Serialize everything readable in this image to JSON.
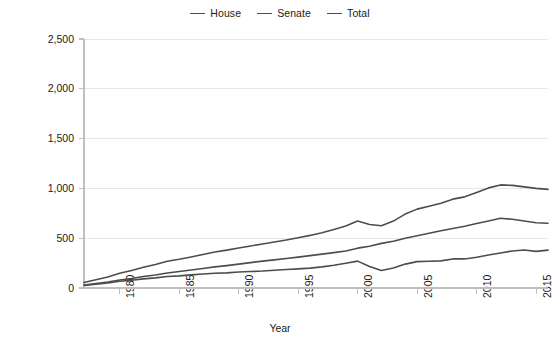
{
  "chart_data": {
    "type": "line",
    "title": "",
    "xlabel": "Year",
    "ylabel": "Millions of Nominal Dollars",
    "xlim": [
      1977,
      2016
    ],
    "ylim": [
      0,
      2500
    ],
    "grid": true,
    "legend_position": "top-center",
    "y_ticks": [
      "0",
      "500",
      "1,000",
      "1,500",
      "2,000",
      "2,500"
    ],
    "y_tick_values": [
      0,
      500,
      1000,
      1500,
      2000,
      2500
    ],
    "x_ticks": [
      "1980",
      "1985",
      "1990",
      "1995",
      "2000",
      "2005",
      "2010",
      "2015"
    ],
    "x_tick_values": [
      1980,
      1985,
      1990,
      1995,
      2000,
      2005,
      2010,
      2015
    ],
    "x": [
      1977,
      1978,
      1979,
      1980,
      1981,
      1982,
      1983,
      1984,
      1985,
      1986,
      1987,
      1988,
      1989,
      1990,
      1991,
      1992,
      1993,
      1994,
      1995,
      1996,
      1997,
      1998,
      1999,
      2000,
      2001,
      2002,
      2003,
      2004,
      2005,
      2006,
      2007,
      2008,
      2009,
      2010,
      2011,
      2012,
      2013,
      2014,
      2015,
      2016
    ],
    "series": [
      {
        "name": "House",
        "color": "#4d4d4d",
        "values": [
          30,
          45,
          60,
          80,
          95,
          115,
          130,
          150,
          165,
          180,
          195,
          212,
          225,
          240,
          255,
          270,
          282,
          296,
          310,
          325,
          340,
          355,
          372,
          400,
          420,
          448,
          470,
          500,
          525,
          550,
          575,
          598,
          620,
          648,
          672,
          700,
          690,
          672,
          655,
          650
        ]
      },
      {
        "name": "Senate",
        "color": "#4d4d4d",
        "values": [
          25,
          38,
          50,
          68,
          78,
          92,
          102,
          115,
          122,
          132,
          140,
          148,
          152,
          160,
          165,
          170,
          178,
          185,
          192,
          200,
          212,
          228,
          248,
          270,
          215,
          175,
          200,
          240,
          265,
          268,
          272,
          292,
          292,
          308,
          332,
          352,
          372,
          382,
          368,
          380
        ]
      },
      {
        "name": "Total",
        "color": "#4d4d4d",
        "values": [
          55,
          82,
          110,
          148,
          175,
          208,
          235,
          268,
          288,
          312,
          336,
          362,
          380,
          402,
          422,
          442,
          462,
          482,
          505,
          528,
          555,
          588,
          622,
          672,
          638,
          625,
          672,
          742,
          792,
          820,
          850,
          892,
          915,
          958,
          1005,
          1035,
          1030,
          1015,
          1000,
          990
        ]
      }
    ]
  },
  "legend": {
    "items": [
      {
        "label": "House"
      },
      {
        "label": "Senate"
      },
      {
        "label": "Total"
      }
    ]
  },
  "axes": {
    "y_title": "Millions of Nominal Dollars",
    "x_title": "Year"
  },
  "colors": {
    "line": "#4d4d4d",
    "axis": "#bfbfbf",
    "grid": "#e8e8e8",
    "text": "#1a1a1a",
    "background": "#ffffff"
  }
}
